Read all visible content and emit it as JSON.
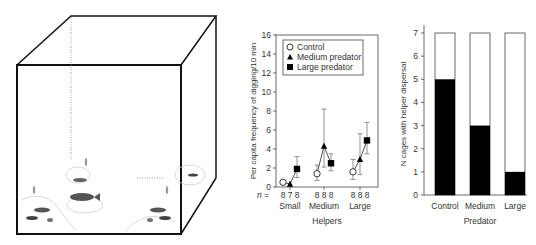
{
  "figure": {
    "panel_a": {
      "description": "Cage illustration with fish (breeding pair and helpers) near shelters",
      "cube_stroke": "#111111"
    },
    "panel_b": {
      "ylabel": "Per capita frequency of digging/10 min",
      "xlabel": "Helpers",
      "n_label": "n =",
      "n_values": [
        "8",
        "7",
        "8",
        "8",
        "8",
        "8",
        "8",
        "8",
        "8"
      ],
      "groups": [
        "Small",
        "Medium",
        "Large"
      ],
      "yticks": [
        "0",
        "2",
        "4",
        "6",
        "8",
        "10",
        "12",
        "14",
        "16"
      ],
      "legend": [
        "Control",
        "Medium predator",
        "Large predator"
      ]
    },
    "panel_c": {
      "ylabel": "N cages with helper dispersal",
      "xlabel": "Predator",
      "categories": [
        "Control",
        "Medium",
        "Large"
      ],
      "yticks": [
        "0",
        "1",
        "2",
        "3",
        "4",
        "5",
        "6",
        "7"
      ]
    }
  },
  "chart_data": [
    {
      "type": "line",
      "title": "",
      "xlabel": "Helpers",
      "ylabel": "Per capita frequency of digging/10 min",
      "ylim": [
        0,
        16
      ],
      "categories": [
        "Small",
        "Medium",
        "Large"
      ],
      "legend_position": "upper-left, inside plot",
      "grid": false,
      "series": [
        {
          "name": "Control",
          "marker": "open-circle",
          "values": [
            0.5,
            1.4,
            1.6
          ],
          "err_low": [
            0.5,
            0.7,
            0.8
          ],
          "err_high": [
            0.5,
            2.3,
            2.9
          ],
          "n": [
            8,
            8,
            8
          ]
        },
        {
          "name": "Medium predator",
          "marker": "filled-triangle",
          "values": [
            0.3,
            4.3,
            2.9
          ],
          "err_low": [
            0.3,
            2.1,
            1.3
          ],
          "err_high": [
            0.3,
            8.2,
            5.6
          ],
          "n": [
            7,
            8,
            8
          ]
        },
        {
          "name": "Large predator",
          "marker": "filled-square",
          "values": [
            1.9,
            2.5,
            4.9
          ],
          "err_low": [
            1.0,
            1.7,
            3.5
          ],
          "err_high": [
            3.2,
            3.5,
            6.8
          ],
          "n": [
            8,
            8,
            8
          ]
        }
      ]
    },
    {
      "type": "bar",
      "title": "",
      "xlabel": "Predator",
      "ylabel": "N cages with helper dispersal",
      "ylim": [
        0,
        7
      ],
      "categories": [
        "Control",
        "Medium",
        "Large"
      ],
      "series": [
        {
          "name": "Cages with helper dispersal",
          "color": "#000000",
          "values": [
            5,
            3,
            1
          ]
        },
        {
          "name": "Total cages",
          "color": "#ffffff",
          "values": [
            7,
            7,
            7
          ]
        }
      ],
      "grid": false
    }
  ]
}
